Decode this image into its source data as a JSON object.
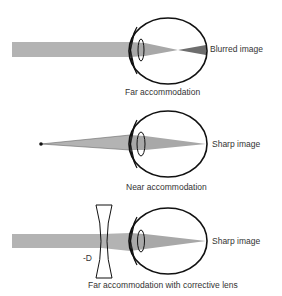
{
  "panels": [
    {
      "id": "far",
      "image_label": "Blurred image",
      "caption": "Far accommodation"
    },
    {
      "id": "near",
      "image_label": "Sharp image",
      "caption": "Near accommodation"
    },
    {
      "id": "corrected",
      "image_label": "Sharp image",
      "caption": "Far accommodation with corrective lens",
      "lens_label": "-D"
    }
  ],
  "colors": {
    "beam": "#b3b3b3",
    "beam_dark": "#6e6e6e",
    "outline": "#111111",
    "text": "#333333"
  }
}
